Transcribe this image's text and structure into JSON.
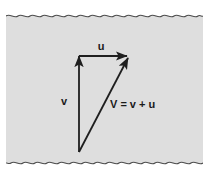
{
  "figure": {
    "kind": "vector-addition-diagram",
    "page_background_color": "#dcdcdc",
    "outer_background_color": "#ffffff",
    "ink_color": "#1f1f1f",
    "edge_color": "#4a4a4a",
    "labels": {
      "u": "u",
      "v": "v",
      "sum": "V = v + u"
    },
    "vectors": [
      {
        "name": "v",
        "label": "v",
        "start": {
          "x": 73,
          "y": 144
        },
        "end": {
          "x": 73,
          "y": 46
        },
        "label_pos": {
          "x": 57,
          "y": 93
        }
      },
      {
        "name": "u",
        "label": "u",
        "start": {
          "x": 73,
          "y": 48
        },
        "end": {
          "x": 124,
          "y": 48
        },
        "label_pos": {
          "x": 95,
          "y": 40
        }
      },
      {
        "name": "V",
        "label": "V = v + u",
        "start": {
          "x": 73,
          "y": 144
        },
        "end": {
          "x": 124,
          "y": 48
        },
        "label_pos": {
          "x": 107,
          "y": 96
        }
      }
    ]
  }
}
